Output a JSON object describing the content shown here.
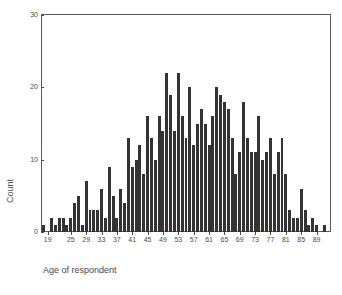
{
  "chart_data": {
    "type": "bar",
    "title": "",
    "subtitle": "",
    "xlabel": "Age of respondent",
    "ylabel": "Count",
    "ylim": [
      0,
      30
    ],
    "yticks": [
      0,
      10,
      20,
      30
    ],
    "ytick_labels": [
      "0",
      "10",
      "20",
      "30"
    ],
    "xlim": [
      18,
      92
    ],
    "xticks": [
      19,
      25,
      29,
      33,
      37,
      41,
      45,
      49,
      53,
      57,
      61,
      65,
      69,
      73,
      77,
      81,
      85,
      89
    ],
    "xtick_labels": [
      "19",
      "25",
      "29",
      "33",
      "37",
      "41",
      "45",
      "49",
      "53",
      "57",
      "61",
      "65",
      "69",
      "73",
      "77",
      "81",
      "85",
      "89"
    ],
    "grid": false,
    "legend": "none",
    "bar_color": "#333333",
    "axis_color": "#5a5a5a",
    "categories": [
      18,
      19,
      20,
      21,
      22,
      23,
      24,
      25,
      26,
      27,
      28,
      29,
      30,
      31,
      32,
      33,
      34,
      35,
      36,
      37,
      38,
      39,
      40,
      41,
      42,
      43,
      44,
      45,
      46,
      47,
      48,
      49,
      50,
      51,
      52,
      53,
      54,
      55,
      56,
      57,
      58,
      59,
      60,
      61,
      62,
      63,
      64,
      65,
      66,
      67,
      68,
      69,
      70,
      71,
      72,
      73,
      74,
      75,
      76,
      77,
      78,
      79,
      80,
      81,
      82,
      83,
      84,
      85,
      86,
      87,
      88,
      89,
      90,
      91
    ],
    "values": [
      1,
      0,
      2,
      1,
      2,
      2,
      1,
      2,
      4,
      5,
      1,
      7,
      3,
      3,
      3,
      6,
      2,
      9,
      5,
      2,
      6,
      4,
      13,
      9,
      10,
      12,
      8,
      16,
      13,
      10,
      16,
      14,
      22,
      19,
      14,
      22,
      16,
      13,
      20,
      12,
      15,
      17,
      15,
      12,
      16,
      20,
      19,
      18,
      17,
      13,
      8,
      11,
      18,
      13,
      11,
      11,
      16,
      10,
      11,
      13,
      8,
      11,
      13,
      8,
      3,
      2,
      2,
      6,
      3,
      1,
      2,
      1,
      0,
      1
    ]
  }
}
